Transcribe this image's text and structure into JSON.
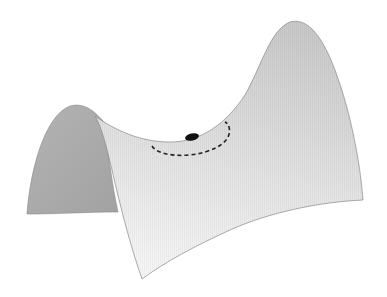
{
  "figure": {
    "background": "#ffffff",
    "colors": {
      "back_face_dark": "#a9a9a9",
      "back_face_light": "#c4c4c4",
      "front_face_top": "#cfcfcf",
      "front_face_bottom": "#f4f4f4",
      "edge": "#8a8a8a",
      "ball": "#111111",
      "dashed_path": "#222222"
    },
    "elements": {
      "surface": "saddle-surface",
      "ball": "ball at saddle point",
      "path": "dashed elliptical path around saddle point"
    }
  }
}
